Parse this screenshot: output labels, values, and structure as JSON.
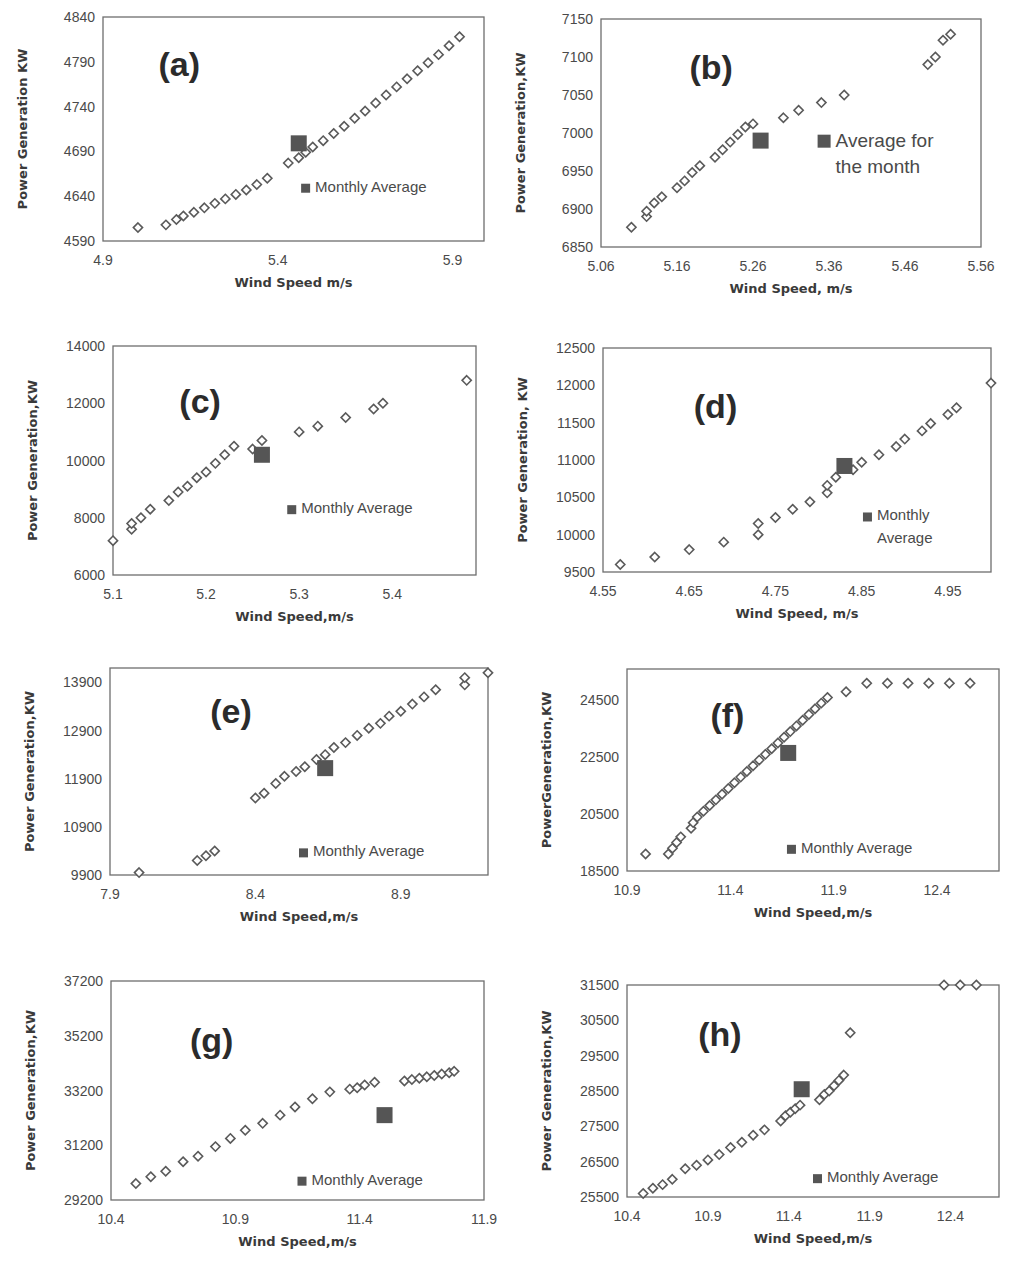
{
  "figure": {
    "y_axis_label_default": "Power Generation,KW",
    "x_axis_label_default": "Wind Speed,m/s",
    "marker_color": "#5a5a5a",
    "average_color": "#555555"
  },
  "chart_data": [
    {
      "id": "a",
      "type": "scatter",
      "panel_label": "(a)",
      "xlabel": "Wind Speed m/s",
      "ylabel": "Power Generation KW",
      "xlim": [
        4.9,
        5.99
      ],
      "ylim": [
        4590,
        4840
      ],
      "xticks": [
        "4.9",
        "5.4",
        "5.9"
      ],
      "xtick_values": [
        4.9,
        5.4,
        5.9
      ],
      "yticks": [
        "4590",
        "4640",
        "4690",
        "4740",
        "4790",
        "4840"
      ],
      "ytick_values": [
        4590,
        4640,
        4690,
        4740,
        4790,
        4840
      ],
      "legend": [
        "Monthly Average"
      ],
      "legend_pos": [
        0.52,
        0.22
      ],
      "label_pos": [
        0.2,
        0.8
      ],
      "series": [
        {
          "name": "Daily",
          "x": [
            5.0,
            5.08,
            5.11,
            5.13,
            5.16,
            5.19,
            5.22,
            5.25,
            5.28,
            5.31,
            5.34,
            5.37,
            5.43,
            5.46,
            5.48,
            5.5,
            5.53,
            5.56,
            5.59,
            5.62,
            5.65,
            5.68,
            5.71,
            5.74,
            5.77,
            5.8,
            5.83,
            5.86,
            5.89,
            5.92
          ],
          "y": [
            4605,
            4608,
            4614,
            4618,
            4622,
            4627,
            4632,
            4637,
            4642,
            4647,
            4653,
            4660,
            4677,
            4683,
            4689,
            4695,
            4702,
            4710,
            4718,
            4727,
            4735,
            4744,
            4753,
            4762,
            4771,
            4780,
            4789,
            4798,
            4808,
            4818
          ]
        },
        {
          "name": "Monthly Average",
          "x": [
            5.46
          ],
          "y": [
            4699
          ]
        }
      ]
    },
    {
      "id": "b",
      "type": "scatter",
      "panel_label": "(b)",
      "xlabel": "Wind Speed, m/s",
      "ylabel": "Power Generation,KW",
      "xlim": [
        5.06,
        5.56
      ],
      "ylim": [
        6850,
        7150
      ],
      "xticks": [
        "5.06",
        "5.16",
        "5.26",
        "5.36",
        "5.46",
        "5.56"
      ],
      "xtick_values": [
        5.06,
        5.16,
        5.26,
        5.36,
        5.46,
        5.56
      ],
      "yticks": [
        "6850",
        "6900",
        "6950",
        "7000",
        "7050",
        "7100",
        "7150"
      ],
      "ytick_values": [
        6850,
        6900,
        6950,
        7000,
        7050,
        7100,
        7150
      ],
      "legend": [
        "Average for",
        "the month"
      ],
      "legend_pos": [
        0.57,
        0.44
      ],
      "legend_big": true,
      "label_pos": [
        0.29,
        0.8
      ],
      "series": [
        {
          "name": "Daily",
          "x": [
            5.1,
            5.12,
            5.12,
            5.13,
            5.14,
            5.16,
            5.17,
            5.18,
            5.19,
            5.21,
            5.22,
            5.23,
            5.24,
            5.25,
            5.26,
            5.3,
            5.32,
            5.35,
            5.38,
            5.49,
            5.5,
            5.51,
            5.52
          ],
          "y": [
            6876,
            6890,
            6897,
            6908,
            6916,
            6928,
            6937,
            6948,
            6957,
            6968,
            6978,
            6988,
            6998,
            7008,
            7012,
            7020,
            7030,
            7040,
            7050,
            7090,
            7100,
            7122,
            7130
          ]
        },
        {
          "name": "Average for the month",
          "x": [
            5.27
          ],
          "y": [
            6990
          ]
        }
      ]
    },
    {
      "id": "c",
      "type": "scatter",
      "panel_label": "(c)",
      "xlabel": "Wind Speed,m/s",
      "ylabel": "Power Generation,KW",
      "xlim": [
        5.1,
        5.49
      ],
      "ylim": [
        6000,
        14000
      ],
      "xticks": [
        "5.1",
        "5.2",
        "5.3",
        "5.4"
      ],
      "xtick_values": [
        5.1,
        5.2,
        5.3,
        5.4
      ],
      "yticks": [
        "6000",
        "8000",
        "10000",
        "12000",
        "14000"
      ],
      "ytick_values": [
        6000,
        8000,
        10000,
        12000,
        14000
      ],
      "legend": [
        "Monthly Average"
      ],
      "legend_pos": [
        0.48,
        0.27
      ],
      "label_pos": [
        0.24,
        0.77
      ],
      "series": [
        {
          "name": "Daily",
          "x": [
            5.1,
            5.12,
            5.12,
            5.13,
            5.14,
            5.16,
            5.17,
            5.18,
            5.19,
            5.2,
            5.21,
            5.22,
            5.23,
            5.25,
            5.26,
            5.3,
            5.32,
            5.35,
            5.38,
            5.39,
            5.48
          ],
          "y": [
            7200,
            7600,
            7800,
            8000,
            8300,
            8600,
            8900,
            9100,
            9400,
            9600,
            9900,
            10200,
            10500,
            10400,
            10700,
            11000,
            11200,
            11500,
            11800,
            12000,
            12800
          ]
        },
        {
          "name": "Monthly Average",
          "x": [
            5.26
          ],
          "y": [
            10200
          ]
        }
      ]
    },
    {
      "id": "d",
      "type": "scatter",
      "panel_label": "(d)",
      "xlabel": "Wind Speed, m/s",
      "ylabel": "Power Generation, KW",
      "xlim": [
        4.55,
        5.0
      ],
      "ylim": [
        9500,
        12500
      ],
      "xticks": [
        "4.55",
        "4.65",
        "4.75",
        "4.85",
        "4.95"
      ],
      "xtick_values": [
        4.55,
        4.65,
        4.75,
        4.85,
        4.95
      ],
      "yticks": [
        "9500",
        "10000",
        "10500",
        "11000",
        "11500",
        "12000",
        "12500"
      ],
      "ytick_values": [
        9500,
        10000,
        10500,
        11000,
        11500,
        12000,
        12500
      ],
      "legend": [
        "Monthly",
        "Average"
      ],
      "legend_pos": [
        0.67,
        0.23
      ],
      "label_pos": [
        0.29,
        0.75
      ],
      "series": [
        {
          "name": "Daily",
          "x": [
            4.57,
            4.61,
            4.65,
            4.69,
            4.73,
            4.73,
            4.75,
            4.77,
            4.79,
            4.81,
            4.81,
            4.82,
            4.84,
            4.85,
            4.87,
            4.89,
            4.9,
            4.92,
            4.93,
            4.95,
            4.96,
            5.0
          ],
          "y": [
            9600,
            9700,
            9800,
            9900,
            10000,
            10150,
            10230,
            10340,
            10440,
            10560,
            10660,
            10770,
            10870,
            10970,
            11070,
            11180,
            11280,
            11390,
            11490,
            11610,
            11700,
            12030
          ]
        },
        {
          "name": "Monthly Average",
          "x": [
            4.83
          ],
          "y": [
            10920
          ]
        }
      ]
    },
    {
      "id": "e",
      "type": "scatter",
      "panel_label": "(e)",
      "xlabel": "Wind Speed,m/s",
      "ylabel": "Power Generation,KW",
      "xlim": [
        7.9,
        9.2
      ],
      "ylim": [
        9900,
        14200
      ],
      "xticks": [
        "7.9",
        "8.4",
        "8.9"
      ],
      "xtick_values": [
        7.9,
        8.4,
        8.9
      ],
      "yticks": [
        "9900",
        "10900",
        "11900",
        "12900",
        "13900"
      ],
      "ytick_values": [
        9900,
        10900,
        11900,
        12900,
        13900
      ],
      "legend": [
        "Monthly Average"
      ],
      "legend_pos": [
        0.5,
        0.09
      ],
      "label_pos": [
        0.32,
        0.8
      ],
      "series": [
        {
          "name": "Daily",
          "x": [
            8.0,
            8.2,
            8.23,
            8.26,
            8.4,
            8.43,
            8.47,
            8.5,
            8.54,
            8.57,
            8.61,
            8.64,
            8.67,
            8.71,
            8.75,
            8.79,
            8.83,
            8.86,
            8.9,
            8.94,
            8.98,
            9.02,
            9.12,
            9.12,
            9.2
          ],
          "y": [
            9950,
            10200,
            10300,
            10400,
            11500,
            11600,
            11800,
            11950,
            12050,
            12150,
            12300,
            12400,
            12550,
            12650,
            12800,
            12950,
            13050,
            13200,
            13300,
            13450,
            13600,
            13750,
            13850,
            14000,
            14100
          ]
        },
        {
          "name": "Monthly Average",
          "x": [
            8.64
          ],
          "y": [
            12120
          ]
        }
      ]
    },
    {
      "id": "f",
      "type": "scatter",
      "panel_label": "(f)",
      "xlabel": "Wind Speed,m/s",
      "ylabel": "PowerGeneration,KW",
      "xlim": [
        10.9,
        12.7
      ],
      "ylim": [
        18500,
        25600
      ],
      "xticks": [
        "10.9",
        "11.4",
        "11.9",
        "12.4"
      ],
      "xtick_values": [
        10.9,
        11.4,
        11.9,
        12.4
      ],
      "yticks": [
        "18500",
        "20500",
        "22500",
        "24500"
      ],
      "ytick_values": [
        18500,
        20500,
        22500,
        24500
      ],
      "legend": [
        "Monthly Average"
      ],
      "legend_pos": [
        0.43,
        0.09
      ],
      "label_pos": [
        0.27,
        0.78
      ],
      "series": [
        {
          "name": "Daily",
          "x": [
            10.99,
            11.1,
            11.12,
            11.14,
            11.16,
            11.21,
            11.22,
            11.24,
            11.27,
            11.3,
            11.33,
            11.36,
            11.39,
            11.42,
            11.45,
            11.48,
            11.51,
            11.54,
            11.57,
            11.6,
            11.63,
            11.66,
            11.69,
            11.72,
            11.75,
            11.78,
            11.81,
            11.84,
            11.87,
            11.96,
            12.06,
            12.16,
            12.26,
            12.36,
            12.46,
            12.56
          ],
          "y": [
            19100,
            19100,
            19300,
            19500,
            19700,
            20000,
            20200,
            20400,
            20600,
            20800,
            21000,
            21200,
            21400,
            21600,
            21800,
            22000,
            22200,
            22400,
            22600,
            22800,
            23000,
            23200,
            23400,
            23600,
            23800,
            24000,
            24200,
            24400,
            24600,
            24800,
            25100,
            25100,
            25100,
            25100,
            25100,
            25100
          ]
        },
        {
          "name": "Monthly Average",
          "x": [
            11.68
          ],
          "y": [
            22650
          ]
        }
      ]
    },
    {
      "id": "g",
      "type": "scatter",
      "panel_label": "(g)",
      "xlabel": "Wind Speed,m/s",
      "ylabel": "Power Generation,KW",
      "xlim": [
        10.4,
        11.9
      ],
      "ylim": [
        29200,
        37200
      ],
      "xticks": [
        "10.4",
        "10.9",
        "11.4",
        "11.9"
      ],
      "xtick_values": [
        10.4,
        10.9,
        11.4,
        11.9
      ],
      "yticks": [
        "29200",
        "31200",
        "33200",
        "35200",
        "37200"
      ],
      "ytick_values": [
        29200,
        31200,
        33200,
        35200,
        37200
      ],
      "legend": [
        "Monthly Average"
      ],
      "legend_pos": [
        0.5,
        0.07
      ],
      "label_pos": [
        0.27,
        0.74
      ],
      "series": [
        {
          "name": "Daily",
          "x": [
            10.5,
            10.56,
            10.62,
            10.69,
            10.75,
            10.82,
            10.88,
            10.94,
            11.01,
            11.08,
            11.14,
            11.21,
            11.28,
            11.36,
            11.39,
            11.42,
            11.46,
            11.58,
            11.61,
            11.64,
            11.67,
            11.7,
            11.73,
            11.76,
            11.78
          ],
          "y": [
            29800,
            30050,
            30250,
            30600,
            30800,
            31150,
            31450,
            31750,
            32000,
            32300,
            32600,
            32900,
            33150,
            33250,
            33300,
            33400,
            33500,
            33550,
            33600,
            33650,
            33700,
            33750,
            33800,
            33850,
            33900
          ]
        },
        {
          "name": "Monthly Average",
          "x": [
            11.5
          ],
          "y": [
            32300
          ]
        }
      ]
    },
    {
      "id": "h",
      "type": "scatter",
      "panel_label": "(h)",
      "xlabel": "Wind Speed,m/s",
      "ylabel": "Power Generation,KW",
      "xlim": [
        10.4,
        12.7
      ],
      "ylim": [
        25500,
        31500
      ],
      "xticks": [
        "10.4",
        "10.9",
        "11.4",
        "11.9",
        "12.4"
      ],
      "xtick_values": [
        10.4,
        10.9,
        11.4,
        11.9,
        12.4
      ],
      "yticks": [
        "25500",
        "26500",
        "27500",
        "28500",
        "29500",
        "30500",
        "31500"
      ],
      "ytick_values": [
        25500,
        26500,
        27500,
        28500,
        29500,
        30500,
        31500
      ],
      "legend": [
        "Monthly Average"
      ],
      "legend_pos": [
        0.5,
        0.07
      ],
      "label_pos": [
        0.25,
        0.78
      ],
      "series": [
        {
          "name": "Daily",
          "x": [
            10.5,
            10.56,
            10.62,
            10.68,
            10.76,
            10.83,
            10.9,
            10.97,
            11.04,
            11.11,
            11.18,
            11.25,
            11.35,
            11.38,
            11.41,
            11.44,
            11.47,
            11.59,
            11.62,
            11.65,
            11.68,
            11.71,
            11.74,
            11.78,
            12.36,
            12.46,
            12.56
          ],
          "y": [
            25600,
            25750,
            25850,
            26000,
            26300,
            26400,
            26550,
            26700,
            26900,
            27050,
            27250,
            27400,
            27650,
            27800,
            27900,
            28000,
            28100,
            28250,
            28400,
            28500,
            28650,
            28800,
            28950,
            30150,
            31500,
            31500,
            31500
          ]
        },
        {
          "name": "Monthly Average",
          "x": [
            11.48
          ],
          "y": [
            28550
          ]
        }
      ]
    }
  ]
}
